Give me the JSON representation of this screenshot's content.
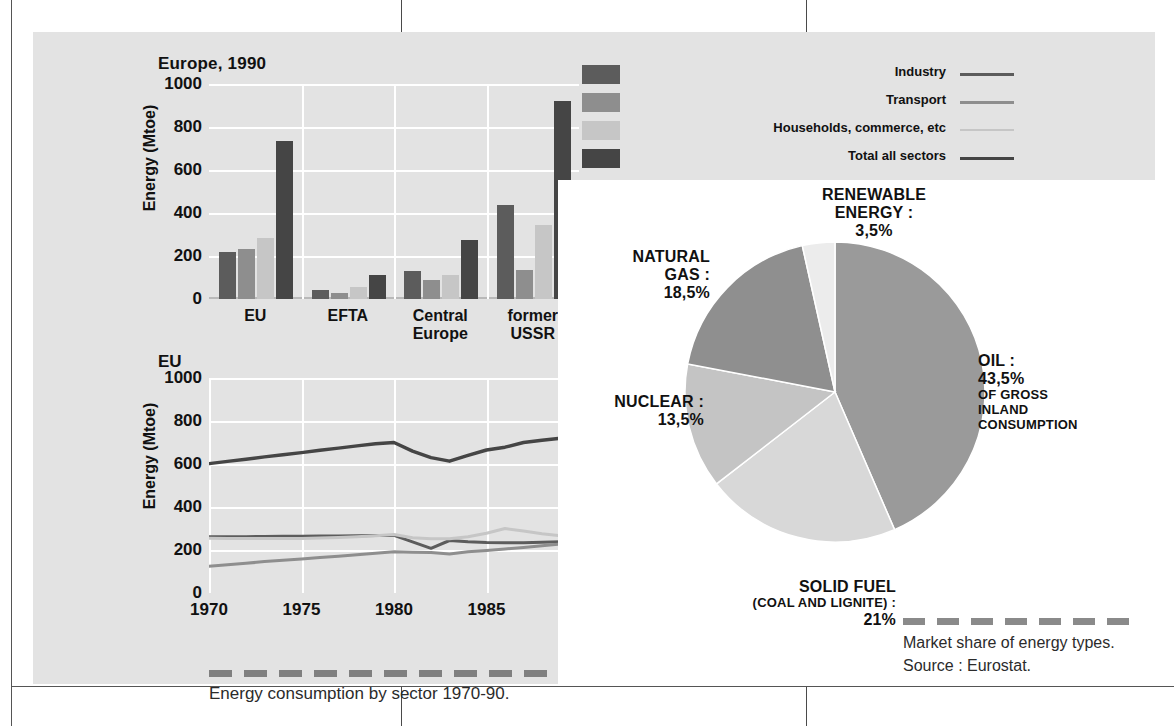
{
  "colors": {
    "panel_bg": "#e3e3e3",
    "pie_panel_bg": "#ffffff",
    "industry": "#5c5c5c",
    "transport": "#8e8e8e",
    "households": "#c6c6c6",
    "total": "#454545",
    "grid": "#ffffff",
    "oil": "#9a9a9a",
    "solid_fuel": "#d8d8d8",
    "nuclear": "#c4c4c4",
    "natural_gas": "#8f8f8f",
    "renewable": "#ececec"
  },
  "legend": {
    "items": [
      {
        "label": "Industry",
        "color": "#5c5c5c"
      },
      {
        "label": "Transport",
        "color": "#8e8e8e"
      },
      {
        "label": "Households, commerce, etc",
        "color": "#c6c6c6"
      },
      {
        "label": "Total all sectors",
        "color": "#454545"
      }
    ]
  },
  "chart_data": [
    {
      "type": "bar",
      "title": "Europe, 1990",
      "xlabel": "",
      "ylabel": "Energy (Mtoe)",
      "ylim": [
        0,
        1000
      ],
      "yticks": [
        0,
        200,
        400,
        600,
        800,
        1000
      ],
      "grid": true,
      "legend_position": "top-right",
      "categories": [
        "EU",
        "EFTA",
        "Central Europe",
        "former USSR"
      ],
      "series": [
        {
          "name": "Industry",
          "color": "#5c5c5c",
          "values": [
            220,
            42,
            132,
            435
          ]
        },
        {
          "name": "Transport",
          "color": "#8e8e8e",
          "values": [
            232,
            28,
            90,
            135
          ]
        },
        {
          "name": "Households, commerce, etc",
          "color": "#c6c6c6",
          "values": [
            285,
            55,
            110,
            345
          ]
        },
        {
          "name": "Total all sectors",
          "color": "#454545",
          "values": [
            735,
            112,
            275,
            920
          ]
        }
      ]
    },
    {
      "type": "line",
      "title": "EU",
      "xlabel": "",
      "ylabel": "Energy (Mtoe)",
      "ylim": [
        0,
        1000
      ],
      "yticks": [
        0,
        200,
        400,
        600,
        800,
        1000
      ],
      "xlim": [
        1970,
        1990
      ],
      "xticks": [
        1970,
        1975,
        1980,
        1985,
        1990
      ],
      "grid": true,
      "x": [
        1970,
        1971,
        1972,
        1973,
        1974,
        1975,
        1976,
        1977,
        1978,
        1979,
        1980,
        1981,
        1982,
        1983,
        1984,
        1985,
        1986,
        1987,
        1988,
        1989,
        1990
      ],
      "series": [
        {
          "name": "Total all sectors",
          "color": "#454545",
          "values": [
            602,
            612,
            622,
            633,
            643,
            653,
            664,
            674,
            684,
            694,
            700,
            660,
            630,
            613,
            640,
            665,
            678,
            700,
            710,
            720,
            733
          ]
        },
        {
          "name": "Industry",
          "color": "#5c5c5c",
          "values": [
            262,
            262,
            262,
            263,
            264,
            264,
            265,
            265,
            266,
            267,
            268,
            238,
            208,
            244,
            238,
            235,
            234,
            234,
            236,
            238,
            240
          ]
        },
        {
          "name": "Households, commerce, etc",
          "color": "#c6c6c6",
          "values": [
            255,
            254,
            254,
            253,
            253,
            254,
            256,
            258,
            262,
            266,
            272,
            257,
            252,
            252,
            262,
            278,
            300,
            288,
            276,
            266,
            258
          ]
        },
        {
          "name": "Transport",
          "color": "#8e8e8e",
          "values": [
            124,
            131,
            138,
            146,
            152,
            158,
            165,
            171,
            178,
            185,
            192,
            190,
            188,
            182,
            192,
            198,
            205,
            212,
            220,
            228,
            236
          ]
        }
      ]
    },
    {
      "type": "pie",
      "title": "Market share of energy types.",
      "start_angle_deg": 0,
      "direction": "clockwise",
      "labels": [
        "OIL",
        "SOLID FUEL (COAL AND LIGNITE)",
        "NUCLEAR",
        "NATURAL GAS",
        "RENEWABLE ENERGY"
      ],
      "values": [
        43.5,
        21,
        13.5,
        18.5,
        3.5
      ],
      "colors": [
        "#9a9a9a",
        "#d8d8d8",
        "#c4c4c4",
        "#8f8f8f",
        "#ececec"
      ]
    }
  ],
  "bar_chart": {
    "title": "Europe, 1990",
    "ylabel": "Energy (Mtoe)",
    "yticks": [
      "1000",
      "800",
      "600",
      "400",
      "200",
      "0"
    ],
    "categories": [
      {
        "line1": "EU",
        "line2": ""
      },
      {
        "line1": "EFTA",
        "line2": ""
      },
      {
        "line1": "Central",
        "line2": "Europe"
      },
      {
        "line1": "former",
        "line2": "USSR"
      }
    ]
  },
  "line_chart": {
    "title": "EU",
    "ylabel": "Energy (Mtoe)",
    "yticks": [
      "1000",
      "800",
      "600",
      "400",
      "200",
      "0"
    ],
    "xticks": [
      "1970",
      "1975",
      "1980",
      "1985",
      "1990"
    ],
    "caption": "Energy consumption by sector 1970-90."
  },
  "pie_chart": {
    "labels": {
      "renewable": {
        "l1": "RENEWABLE",
        "l2": "ENERGY :",
        "l3": "3,5%"
      },
      "natural_gas": {
        "l1": "NATURAL",
        "l2": "GAS :",
        "l3": "18,5%"
      },
      "nuclear": {
        "l1": "NUCLEAR :",
        "l2": "13,5%"
      },
      "solid_fuel": {
        "l1": "SOLID FUEL",
        "l2": "(COAL AND LIGNITE) :",
        "l3": "21%"
      },
      "oil": {
        "l1": "OIL :",
        "l2": "43,5%",
        "l3": "OF GROSS",
        "l4": "INLAND",
        "l5": "CONSUMPTION"
      }
    },
    "source_line1": "Market share of energy types.",
    "source_line2": "Source : Eurostat."
  }
}
